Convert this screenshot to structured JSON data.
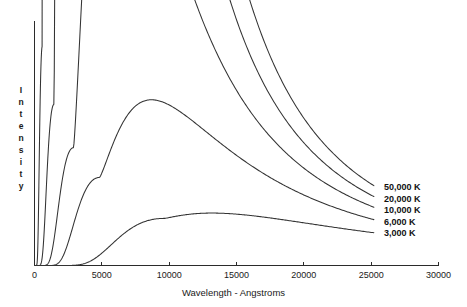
{
  "chart_data": {
    "type": "line",
    "title": "",
    "xlabel": "Wavelength - Angstroms",
    "ylabel": "Intensity",
    "ylabel_letters": [
      "I",
      "n",
      "t",
      "e",
      "n",
      "s",
      "i",
      "t",
      "y"
    ],
    "xlim": [
      0,
      30000
    ],
    "ylim": [
      0,
      1
    ],
    "xticks": [
      0,
      5000,
      10000,
      15000,
      20000,
      25000,
      30000
    ],
    "xticklabels": [
      "0",
      "5000",
      "10000",
      "15000",
      "20000",
      "25000",
      "30000"
    ],
    "yticks": [],
    "yticklabels": [],
    "grid": false,
    "legend_position": "right-inside",
    "line_color": "#333333",
    "axis_color": "#2b2b2b",
    "background": "#ffffff",
    "series": [
      {
        "name": "50,000 K",
        "temperature_k": 50000,
        "peak_wavelength_angstroms": 580,
        "peak_intensity": 0.885,
        "end_intensity": 0.322,
        "label": "50,000 K"
      },
      {
        "name": "20,000 K",
        "temperature_k": 20000,
        "peak_wavelength_angstroms": 1450,
        "peak_intensity": 0.65,
        "end_intensity": 0.278,
        "label": "20,000 K"
      },
      {
        "name": "10,000 K",
        "temperature_k": 10000,
        "peak_wavelength_angstroms": 2900,
        "peak_intensity": 0.475,
        "end_intensity": 0.235,
        "label": "10,000 K"
      },
      {
        "name": "6,000 K",
        "temperature_k": 6000,
        "peak_wavelength_angstroms": 4830,
        "peak_intensity": 0.355,
        "end_intensity": 0.185,
        "label": "6,000 K"
      },
      {
        "name": "3,000 K",
        "temperature_k": 3000,
        "peak_wavelength_angstroms": 9660,
        "peak_intensity": 0.19,
        "end_intensity": 0.132,
        "label": "3,000 K"
      }
    ],
    "legend_entries": [
      "50,000 K",
      "20,000 K",
      "10,000 K",
      "6,000 K",
      "3,000 K"
    ]
  }
}
